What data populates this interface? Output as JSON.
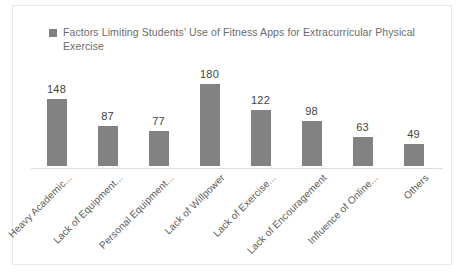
{
  "chart_data": {
    "type": "bar",
    "title": "",
    "legend": [
      "Factors Limiting Students' Use of Fitness Apps for Extracurricular Physical Exercise"
    ],
    "legend_position": "top-left",
    "legend_marker": "legend-square-marker",
    "series_name": "Factors Limiting Students' Use of Fitness Apps for Extracurricular Physical Exercise",
    "categories": [
      "Heavy Academic...",
      "Lack of Equipment...",
      "Personal Equipment...",
      "Lack of Willpower",
      "Lack of Exercise...",
      "Lack of Encouragement",
      "Influence of Online...",
      "Others"
    ],
    "values": [
      148,
      87,
      77,
      180,
      122,
      98,
      63,
      49
    ],
    "data_labels": [
      "148",
      "87",
      "77",
      "180",
      "122",
      "98",
      "63",
      "49"
    ],
    "xlabel": "",
    "ylabel": "",
    "ylim": [
      0,
      180
    ],
    "grid": false,
    "axis_visible": true,
    "y_axis_ticks_visible": false,
    "bar_color": "#828282",
    "label_color": "#5c5c5c",
    "value_color": "#3f3f3f",
    "background": "#ffffff",
    "border_color": "#e8e8e8"
  }
}
